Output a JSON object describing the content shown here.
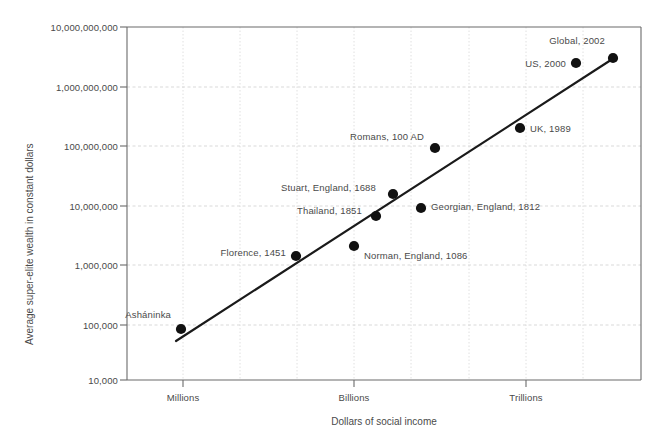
{
  "chart_data": {
    "type": "scatter",
    "title": "",
    "subtitle": "",
    "xlabel": "Dollars of social income",
    "ylabel": "Average super-elite wealth in constant dollars",
    "xscale": "log",
    "yscale": "log",
    "grid": true,
    "legend": "none",
    "ylim": [
      10000,
      10000000000
    ],
    "ytick_labels": [
      "10,000,000,000",
      "1,000,000,000",
      "100,000,000",
      "10,000,000",
      "1,000,000",
      "100,000",
      "10,000"
    ],
    "ytick_values": [
      10000000000,
      1000000000,
      100000000,
      10000000,
      1000000,
      100000,
      10000
    ],
    "xtick_labels": [
      "Millions",
      "Billions",
      "Trillions"
    ],
    "xtick_values": [
      1000000,
      1000000000,
      1000000000000
    ],
    "points": [
      {
        "label": "Ashaninka",
        "label_text": "Asháninka",
        "x_px": 181,
        "y_px": 329,
        "x_value": 1000000,
        "y_value": 80000,
        "label_side": "left",
        "label_dx": -10,
        "label_dy": -15
      },
      {
        "label": "Florence, 1451",
        "label_text": "Florence, 1451",
        "x_px": 296,
        "y_px": 256,
        "x_value": 110000000,
        "y_value": 1300000,
        "label_side": "left",
        "label_dx": -10,
        "label_dy": -4
      },
      {
        "label": "Norman, England, 1086",
        "label_text": "Norman, England, 1086",
        "x_px": 354,
        "y_px": 246,
        "x_value": 1000000000,
        "y_value": 1800000,
        "label_side": "right",
        "label_dx": 10,
        "label_dy": 9
      },
      {
        "label": "Thailand, 1851",
        "label_text": "Thailand, 1851",
        "x_px": 376,
        "y_px": 216,
        "x_value": 2400000000,
        "y_value": 6000000,
        "label_side": "left",
        "label_dx": -14,
        "label_dy": -6
      },
      {
        "label": "Stuart, England, 1688",
        "label_text": "Stuart, England, 1688",
        "x_px": 393,
        "y_px": 194,
        "x_value": 4800000000,
        "y_value": 14000000,
        "label_side": "left",
        "label_dx": -17,
        "label_dy": -7
      },
      {
        "label": "Georgian, England, 1812",
        "label_text": "Georgian, England, 1812",
        "x_px": 421,
        "y_px": 208,
        "x_value": 14000000000,
        "y_value": 9000000,
        "label_side": "right",
        "label_dx": 10,
        "label_dy": -2
      },
      {
        "label": "Romans, 100 AD",
        "label_text": "Romans, 100 AD",
        "x_px": 435,
        "y_px": 148,
        "x_value": 22000000000,
        "y_value": 90000000,
        "label_side": "left",
        "label_dx": -11,
        "label_dy": -12
      },
      {
        "label": "UK, 1989",
        "label_text": "UK, 1989",
        "x_px": 520,
        "y_px": 128,
        "x_value": 700000000000,
        "y_value": 220000000,
        "label_side": "right",
        "label_dx": 10,
        "label_dy": 0
      },
      {
        "label": "US, 2000",
        "label_text": "US, 2000",
        "x_px": 576,
        "y_px": 63,
        "x_value": 8500000000000,
        "y_value": 2200000000,
        "label_side": "left",
        "label_dx": -10,
        "label_dy": 0
      },
      {
        "label": "Global, 2002",
        "label_text": "Global, 2002",
        "x_px": 613,
        "y_px": 58,
        "x_value": 48000000000000,
        "y_value": 2800000000,
        "label_side": "left",
        "label_dx": -8,
        "label_dy": -18
      }
    ],
    "trendline": {
      "x1_px": 176,
      "y1_px": 341,
      "x2_px": 614,
      "y2_px": 58
    },
    "colors": {
      "marker": "#111111",
      "trendline": "#1a1a1a",
      "axis": "#6b6b6b",
      "grid": "#cfcfcf",
      "text": "#4a4a4a"
    }
  }
}
